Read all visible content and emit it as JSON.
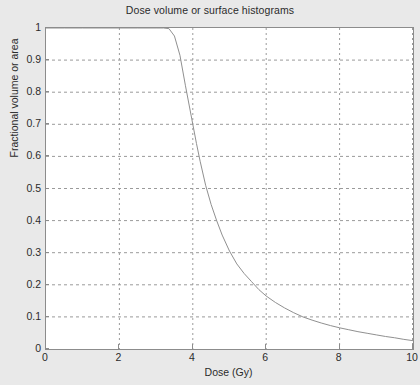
{
  "chart_data": {
    "type": "line",
    "title": "Dose volume or surface histograms",
    "xlabel": "Dose (Gy)",
    "ylabel": "Fractional volume or area",
    "xlim": [
      0,
      10
    ],
    "ylim": [
      0,
      1
    ],
    "xticks": [
      0,
      2,
      4,
      6,
      8,
      10
    ],
    "xtick_labels": [
      "0",
      "2",
      "4",
      "6",
      "8",
      "10"
    ],
    "yticks": [
      0,
      0.1,
      0.2,
      0.3,
      0.4,
      0.5,
      0.6,
      0.7,
      0.8,
      0.9,
      1
    ],
    "ytick_labels": [
      "0",
      "0.1",
      "0.2",
      "0.3",
      "0.4",
      "0.5",
      "0.6",
      "0.7",
      "0.8",
      "0.9",
      "1"
    ],
    "grid": true,
    "grid_style": "dotted",
    "grid_x_positions": [
      2,
      4,
      6,
      8,
      10
    ],
    "grid_y_positions": [
      0.1,
      0.2,
      0.3,
      0.4,
      0.5,
      0.6,
      0.7,
      0.8,
      0.9
    ],
    "legend": null,
    "line_color": "#909090",
    "line_width": 1,
    "series": [
      {
        "name": "Dose volume histogram",
        "x": [
          0.0,
          0.5,
          1.0,
          1.5,
          2.0,
          2.5,
          3.0,
          3.2,
          3.35,
          3.5,
          3.65,
          3.8,
          3.9,
          4.0,
          4.1,
          4.2,
          4.35,
          4.5,
          4.65,
          4.8,
          5.0,
          5.2,
          5.4,
          5.6,
          5.8,
          6.0,
          6.25,
          6.5,
          6.75,
          7.0,
          7.25,
          7.5,
          7.75,
          8.0,
          8.25,
          8.5,
          8.75,
          9.0,
          9.25,
          9.5,
          9.75,
          10.0
        ],
        "y": [
          1.0,
          1.0,
          1.0,
          1.0,
          1.0,
          1.0,
          1.0,
          1.0,
          0.998,
          0.975,
          0.915,
          0.82,
          0.76,
          0.7,
          0.64,
          0.585,
          0.51,
          0.45,
          0.4,
          0.355,
          0.305,
          0.265,
          0.235,
          0.21,
          0.185,
          0.165,
          0.145,
          0.128,
          0.113,
          0.1,
          0.09,
          0.081,
          0.073,
          0.066,
          0.06,
          0.054,
          0.049,
          0.044,
          0.039,
          0.035,
          0.03,
          0.026
        ]
      }
    ]
  },
  "figure": {
    "background_color": "#e9e9e9",
    "plot_background_color": "#ffffff",
    "axis_color": "#8c8c8c"
  }
}
